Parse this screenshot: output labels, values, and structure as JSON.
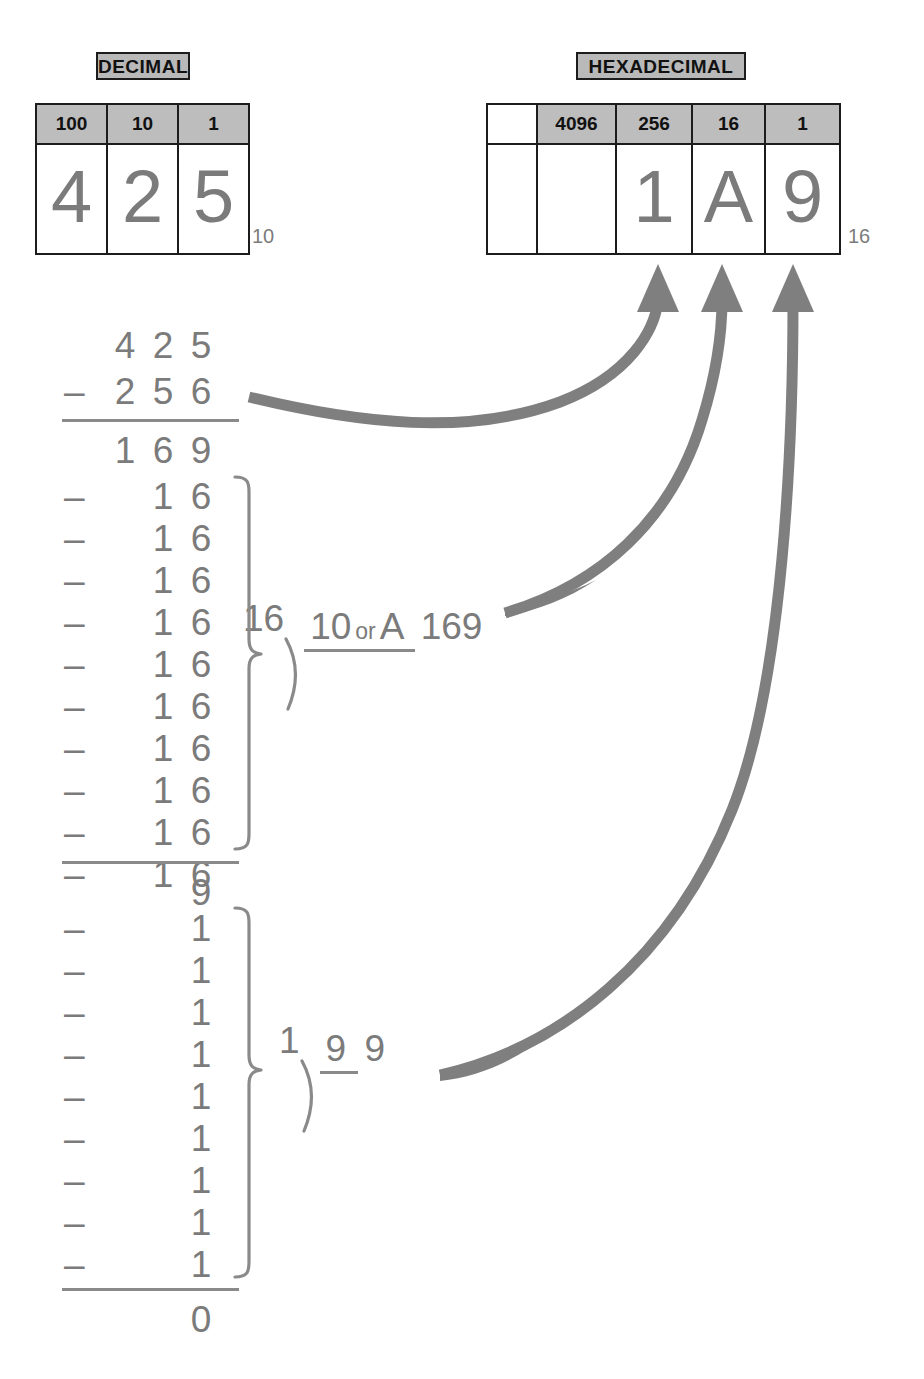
{
  "decimal_table": {
    "caption": "DECIMAL",
    "headers": [
      "100",
      "10",
      "1"
    ],
    "digits": [
      "4",
      "2",
      "5"
    ],
    "subscript": "10"
  },
  "hex_table": {
    "caption": "HEXADECIMAL",
    "headers": [
      "",
      "4096",
      "256",
      "16",
      "1"
    ],
    "digits": [
      "",
      "",
      "1",
      "A",
      "9"
    ],
    "subscript": "16"
  },
  "work": {
    "first_subtraction": {
      "minuend": [
        "4",
        "2",
        "5"
      ],
      "operator": "–",
      "subtrahend": [
        "2",
        "5",
        "6"
      ],
      "difference": [
        "1",
        "6",
        "9"
      ]
    },
    "block_16": {
      "operator": "–",
      "row_digits": [
        "1",
        "6"
      ],
      "row_count": 10,
      "remainder": "9"
    },
    "block_1": {
      "operator": "–",
      "row_digits": [
        "1"
      ],
      "row_count": 9,
      "remainder": "0"
    }
  },
  "divisions": [
    {
      "id": "div-16-169",
      "divisor": "16",
      "dividend": "169",
      "quotient": "10",
      "or_word": "or",
      "quotient_alt": "A",
      "bracket": ")"
    },
    {
      "id": "div-1-9",
      "divisor": "1",
      "dividend": "9",
      "quotient": "9",
      "or_word": "",
      "quotient_alt": "",
      "bracket": ")"
    }
  ],
  "colors": {
    "ink_grey": "#7b7b7b",
    "rule_grey": "#8a8a8a",
    "header_fill": "#bdbdbd",
    "border_black": "#1c1c1c",
    "arrow_grey": "#7f7f7f",
    "page_bg": "#ffffff"
  },
  "arrows": [
    {
      "name": "arrow-to-256-column",
      "from": "first-subtraction-256",
      "to": "hex-digit-1"
    },
    {
      "name": "arrow-to-16-column",
      "from": "quotient-A",
      "to": "hex-digit-A"
    },
    {
      "name": "arrow-to-1-column",
      "from": "quotient-9",
      "to": "hex-digit-9"
    }
  ]
}
